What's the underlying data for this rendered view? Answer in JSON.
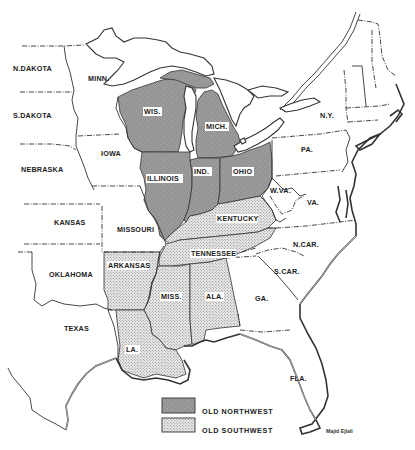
{
  "map": {
    "title": "Old Northwest and Old Southwest",
    "states": [
      {
        "id": "ndakota",
        "label": "N.DAKOTA",
        "region": "none"
      },
      {
        "id": "sdakota",
        "label": "S.DAKOTA",
        "region": "none"
      },
      {
        "id": "nebraska",
        "label": "NEBRASKA",
        "region": "none"
      },
      {
        "id": "kansas",
        "label": "KANSAS",
        "region": "none"
      },
      {
        "id": "oklahoma",
        "label": "OKLAHOMA",
        "region": "none"
      },
      {
        "id": "texas",
        "label": "TEXAS",
        "region": "none"
      },
      {
        "id": "minn",
        "label": "MINN.",
        "region": "none"
      },
      {
        "id": "iowa",
        "label": "IOWA",
        "region": "none"
      },
      {
        "id": "missouri",
        "label": "MISSOURI",
        "region": "none"
      },
      {
        "id": "wis",
        "label": "WIS.",
        "region": "old_northwest"
      },
      {
        "id": "mich",
        "label": "MICH.",
        "region": "old_northwest"
      },
      {
        "id": "illinois",
        "label": "ILLINOIS",
        "region": "old_northwest"
      },
      {
        "id": "ind",
        "label": "IND.",
        "region": "old_northwest"
      },
      {
        "id": "ohio",
        "label": "OHIO",
        "region": "old_northwest"
      },
      {
        "id": "kentucky",
        "label": "KENTUCKY",
        "region": "old_southwest"
      },
      {
        "id": "tennessee",
        "label": "TENNESSEE",
        "region": "old_southwest"
      },
      {
        "id": "arkansas",
        "label": "ARKANSAS",
        "region": "old_southwest"
      },
      {
        "id": "miss",
        "label": "MISS.",
        "region": "old_southwest"
      },
      {
        "id": "ala",
        "label": "ALA.",
        "region": "old_southwest"
      },
      {
        "id": "la",
        "label": "LA.",
        "region": "old_southwest"
      },
      {
        "id": "ny",
        "label": "N.Y.",
        "region": "none"
      },
      {
        "id": "pa",
        "label": "PA.",
        "region": "none"
      },
      {
        "id": "wva",
        "label": "W.VA.",
        "region": "none"
      },
      {
        "id": "va",
        "label": "VA.",
        "region": "none"
      },
      {
        "id": "ncar",
        "label": "N.CAR.",
        "region": "none"
      },
      {
        "id": "scar",
        "label": "S.CAR.",
        "region": "none"
      },
      {
        "id": "ga",
        "label": "GA.",
        "region": "none"
      },
      {
        "id": "fla",
        "label": "FLA.",
        "region": "none"
      }
    ],
    "labels": {
      "ndakota": "N.DAKOTA",
      "sdakota": "S.DAKOTA",
      "nebraska": "NEBRASKA",
      "kansas": "KANSAS",
      "oklahoma": "OKLAHOMA",
      "texas": "TEXAS",
      "minn": "MINN.",
      "iowa": "IOWA",
      "missouri": "MISSOURI",
      "wis": "WIS.",
      "mich": "MICH.",
      "illinois": "ILLINOIS",
      "ind": "IND.",
      "ohio": "OHIO",
      "kentucky": "KENTUCKY",
      "tennessee": "TENNESSEE",
      "arkansas": "ARKANSAS",
      "miss": "MISS.",
      "ala": "ALA.",
      "la": "LA.",
      "ny": "N.Y.",
      "pa": "PA.",
      "wva": "W.VA.",
      "va": "VA.",
      "ncar": "N.CAR.",
      "scar": "S.CAR.",
      "ga": "GA.",
      "fla": "FLA."
    },
    "legend": {
      "items": [
        {
          "pattern": "dark-hatch",
          "label": "OLD NORTHWEST"
        },
        {
          "pattern": "light-dots",
          "label": "OLD SOUTHWEST"
        }
      ]
    },
    "credit": "Majid Ejlali",
    "colors": {
      "old_northwest_fill": "#a8a8a8",
      "old_southwest_fill": "#dcdcdc",
      "border": "#333333",
      "background": "#ffffff"
    }
  }
}
